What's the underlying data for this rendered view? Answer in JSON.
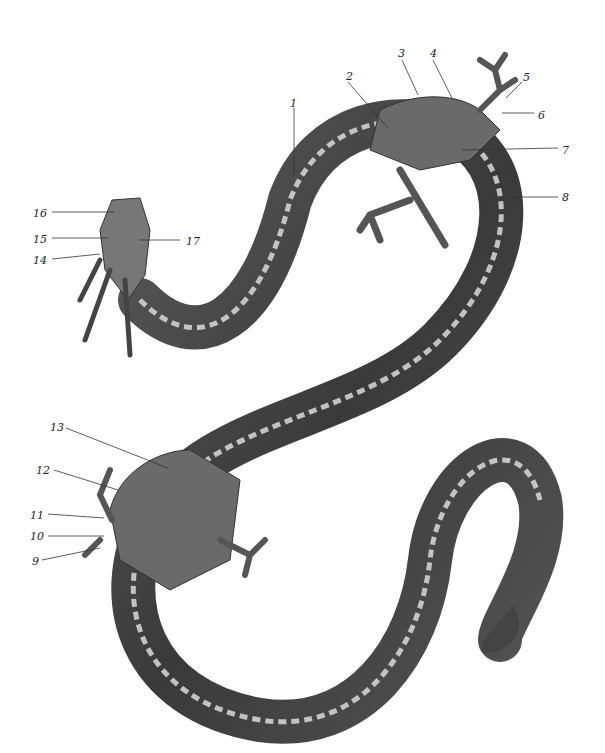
{
  "figure": {
    "labels": [
      {
        "n": "1",
        "x": 290,
        "y": 98,
        "lx1": 294,
        "ly1": 108,
        "lx2": 294,
        "ly2": 175
      },
      {
        "n": "2",
        "x": 346,
        "y": 71,
        "lx1": 348,
        "ly1": 82,
        "lx2": 388,
        "ly2": 128
      },
      {
        "n": "3",
        "x": 398,
        "y": 48,
        "lx1": 402,
        "ly1": 60,
        "lx2": 418,
        "ly2": 95
      },
      {
        "n": "4",
        "x": 430,
        "y": 48,
        "lx1": 433,
        "ly1": 60,
        "lx2": 452,
        "ly2": 98
      },
      {
        "n": "5",
        "x": 523,
        "y": 72,
        "lx1": 522,
        "ly1": 82,
        "lx2": 506,
        "ly2": 98
      },
      {
        "n": "6",
        "x": 538,
        "y": 110,
        "lx1": 502,
        "ly1": 113,
        "lx2": 534,
        "ly2": 113
      },
      {
        "n": "7",
        "x": 562,
        "y": 145,
        "lx1": 462,
        "ly1": 150,
        "lx2": 558,
        "ly2": 148
      },
      {
        "n": "8",
        "x": 562,
        "y": 192,
        "lx1": 512,
        "ly1": 197,
        "lx2": 558,
        "ly2": 197
      },
      {
        "n": "9",
        "x": 32,
        "y": 556,
        "lx1": 42,
        "ly1": 560,
        "lx2": 100,
        "ly2": 548
      },
      {
        "n": "10",
        "x": 30,
        "y": 531,
        "lx1": 48,
        "ly1": 536,
        "lx2": 104,
        "ly2": 536
      },
      {
        "n": "11",
        "x": 30,
        "y": 510,
        "lx1": 48,
        "ly1": 514,
        "lx2": 104,
        "ly2": 518
      },
      {
        "n": "12",
        "x": 36,
        "y": 465,
        "lx1": 54,
        "ly1": 470,
        "lx2": 118,
        "ly2": 490
      },
      {
        "n": "13",
        "x": 50,
        "y": 422,
        "lx1": 66,
        "ly1": 428,
        "lx2": 168,
        "ly2": 468
      },
      {
        "n": "14",
        "x": 33,
        "y": 255,
        "lx1": 52,
        "ly1": 259,
        "lx2": 100,
        "ly2": 254
      },
      {
        "n": "15",
        "x": 33,
        "y": 234,
        "lx1": 52,
        "ly1": 238,
        "lx2": 108,
        "ly2": 238
      },
      {
        "n": "16",
        "x": 33,
        "y": 208,
        "lx1": 52,
        "ly1": 212,
        "lx2": 114,
        "ly2": 212
      },
      {
        "n": "17",
        "x": 186,
        "y": 236,
        "lx1": 140,
        "ly1": 240,
        "lx2": 180,
        "ly2": 240
      }
    ]
  }
}
